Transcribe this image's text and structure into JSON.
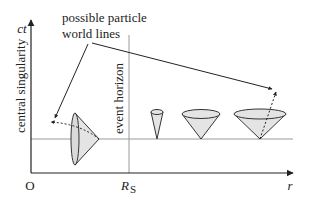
{
  "diagram": {
    "title_label": {
      "line1": "possible particle",
      "line2": "world lines"
    },
    "axes": {
      "y_label": "ct",
      "x_label": "r",
      "origin_label": "O",
      "rs_label_main": "R",
      "rs_label_sub": "S"
    },
    "vertical_labels": {
      "singularity": "central singularity",
      "horizon": "event horizon"
    },
    "colors": {
      "ink": "#222222",
      "grid_line": "#9a9a9a",
      "cone_fill": "#e4e4e4",
      "cone_stroke": "#333333"
    }
  }
}
